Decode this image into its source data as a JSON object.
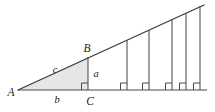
{
  "figure": {
    "type": "geometry-diagram",
    "background_color": "#ffffff",
    "line_color": "#4a4a4a",
    "hypotenuse_color": "#3a3a3a",
    "shade_color": "#e6e6e6",
    "label_color": "#1a1a1a",
    "width": 215,
    "height": 112,
    "vertices": {
      "A": {
        "label": "A",
        "x": 18,
        "y": 90,
        "label_x": 11,
        "label_y": 96
      },
      "B": {
        "label": "B",
        "x": 88,
        "y": 57,
        "label_x": 87,
        "label_y": 52
      },
      "C": {
        "label": "C",
        "x": 88,
        "y": 90,
        "label_x": 90,
        "label_y": 105
      }
    },
    "sides": {
      "a": {
        "label": "a",
        "description": "vertical leg BC",
        "label_x": 96,
        "label_y": 77
      },
      "b": {
        "label": "b",
        "description": "horizontal leg AC",
        "label_x": 57,
        "label_y": 103
      },
      "c": {
        "label": "c",
        "description": "hypotenuse AB",
        "label_x": 55,
        "label_y": 73
      }
    },
    "baseline": {
      "x1": 18,
      "y1": 90,
      "x2": 207,
      "y2": 90
    },
    "ray": {
      "x1": 18,
      "y1": 90,
      "x2": 204,
      "y2": 5
    },
    "apex": {
      "x": 204,
      "y": 5
    },
    "right_angle_marker_size": 7,
    "vertical_segments": [
      {
        "x": 88,
        "y_base": 90,
        "y_top": 57,
        "primary": true
      },
      {
        "x": 127,
        "y_base": 90,
        "y_top": 40,
        "primary": false
      },
      {
        "x": 149,
        "y_base": 90,
        "y_top": 30,
        "primary": false
      },
      {
        "x": 172,
        "y_base": 90,
        "y_top": 19,
        "primary": false
      },
      {
        "x": 186,
        "y_base": 90,
        "y_top": 13,
        "primary": false
      },
      {
        "x": 200,
        "y_base": 90,
        "y_top": 6,
        "primary": false
      }
    ],
    "shaded_triangle": {
      "points": "18,90 88,57 88,90"
    }
  }
}
